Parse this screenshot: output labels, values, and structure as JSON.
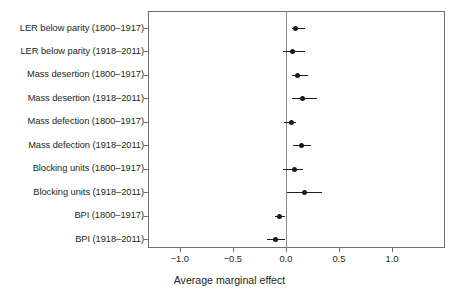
{
  "chart_data": {
    "type": "scatter",
    "subtype": "forest-plot",
    "title": "",
    "xlabel": "Average marginal effect",
    "ylabel": "",
    "xlim": [
      -1.3,
      1.5
    ],
    "xticks": [
      -1.0,
      -0.5,
      0.0,
      0.5,
      1.0
    ],
    "xticklabels": [
      "−1.0",
      "−0.5",
      "0.0",
      "0.5",
      "1.0"
    ],
    "grid": false,
    "legend": null,
    "reference_line": 0.0,
    "categories": [
      "LER below parity (1800–1917)",
      "LER below parity (1918–2011)",
      "Mass desertion (1800–1917)",
      "Mass desertion (1918–2011)",
      "Mass defection (1800–1917)",
      "Mass defection (1918–2011)",
      "Blocking units (1800–1917)",
      "Blocking units (1918–2011)",
      "BPI (1800–1917)",
      "BPI (1918–2011)"
    ],
    "values": [
      0.09,
      0.06,
      0.11,
      0.16,
      0.05,
      0.15,
      0.08,
      0.18,
      -0.06,
      -0.1
    ],
    "ci_low": [
      0.06,
      -0.03,
      0.06,
      0.06,
      -0.02,
      0.07,
      -0.03,
      0.01,
      -0.1,
      -0.18
    ],
    "ci_high": [
      0.18,
      0.18,
      0.21,
      0.29,
      0.1,
      0.24,
      0.16,
      0.34,
      -0.01,
      -0.01
    ],
    "points": [
      {
        "label": "LER below parity (1800–1917)",
        "estimate": 0.09,
        "ci_low": 0.06,
        "ci_high": 0.18
      },
      {
        "label": "LER below parity (1918–2011)",
        "estimate": 0.06,
        "ci_low": -0.03,
        "ci_high": 0.18
      },
      {
        "label": "Mass desertion (1800–1917)",
        "estimate": 0.11,
        "ci_low": 0.06,
        "ci_high": 0.21
      },
      {
        "label": "Mass desertion (1918–2011)",
        "estimate": 0.16,
        "ci_low": 0.06,
        "ci_high": 0.29
      },
      {
        "label": "Mass defection (1800–1917)",
        "estimate": 0.05,
        "ci_low": -0.02,
        "ci_high": 0.1
      },
      {
        "label": "Mass defection (1918–2011)",
        "estimate": 0.15,
        "ci_low": 0.07,
        "ci_high": 0.24
      },
      {
        "label": "Blocking units (1800–1917)",
        "estimate": 0.08,
        "ci_low": -0.03,
        "ci_high": 0.16
      },
      {
        "label": "Blocking units (1918–2011)",
        "estimate": 0.18,
        "ci_low": 0.01,
        "ci_high": 0.34
      },
      {
        "label": "BPI (1800–1917)",
        "estimate": -0.06,
        "ci_low": -0.1,
        "ci_high": -0.01
      },
      {
        "label": "BPI (1918–2011)",
        "estimate": -0.1,
        "ci_low": -0.18,
        "ci_high": -0.01
      }
    ],
    "colors": {
      "point": "#1a1a1a",
      "interval": "#1a1a1a",
      "frame": "#6f6f6f",
      "reference_line": "#8a8a8a",
      "text": "#231f20",
      "background": "#ffffff"
    }
  }
}
